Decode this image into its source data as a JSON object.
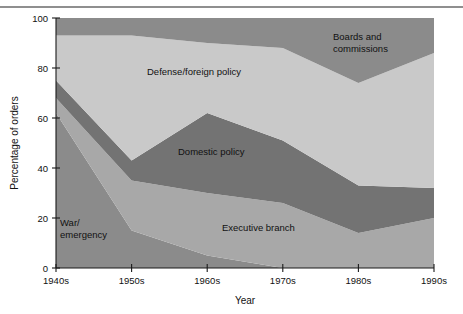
{
  "figure": {
    "background_color": "#ffffff",
    "top_rule_color": "#8f8f8f"
  },
  "chart_data": {
    "type": "area",
    "stacked": true,
    "title": "",
    "xlabel": "Year",
    "ylabel": "Percentage of orders",
    "categories": [
      "1940s",
      "1950s",
      "1960s",
      "1970s",
      "1980s",
      "1990s"
    ],
    "x_tick_labels": [
      "1940s",
      "1950s",
      "1960s",
      "1970s",
      "1980s",
      "1990s"
    ],
    "y_tick_labels": [
      "0",
      "20",
      "40",
      "60",
      "80",
      "100"
    ],
    "y_ticks": [
      0,
      20,
      40,
      60,
      80,
      100
    ],
    "ylim": [
      0,
      100
    ],
    "grid": false,
    "legend_position": "inline-annotations",
    "series": [
      {
        "name": "War/emergency",
        "label": "War/\nemergency",
        "color": "#8b8b8b",
        "values": [
          62,
          15,
          5,
          0,
          0,
          0
        ],
        "annotation": {
          "line1": "War/",
          "line2": "emergency"
        }
      },
      {
        "name": "Executive branch",
        "label": "Executive branch",
        "color": "#a8a8a8",
        "values": [
          6,
          20,
          25,
          26,
          14,
          20
        ],
        "annotation": {
          "line1": "Executive branch"
        }
      },
      {
        "name": "Domestic policy",
        "label": "Domestic policy",
        "color": "#737373",
        "values": [
          7,
          8,
          32,
          25,
          19,
          12
        ],
        "annotation": {
          "line1": "Domestic policy"
        }
      },
      {
        "name": "Defense/foreign policy",
        "label": "Defense/foreign policy",
        "color": "#c9c9c9",
        "values": [
          18,
          50,
          28,
          37,
          41,
          54
        ],
        "annotation": {
          "line1": "Defense/foreign policy"
        }
      },
      {
        "name": "Boards and commissions",
        "label": "Boards and commissions",
        "color": "#8b8b8b",
        "values": [
          7,
          7,
          10,
          12,
          26,
          14
        ],
        "annotation": {
          "line1": "Boards and",
          "line2": "commissions"
        }
      }
    ],
    "cumulative_tops": {
      "war_emergency": [
        62,
        15,
        5,
        0,
        0,
        0
      ],
      "executive_branch": [
        68,
        35,
        30,
        26,
        14,
        20
      ],
      "domestic_policy": [
        75,
        43,
        62,
        51,
        33,
        32
      ],
      "defense_foreign_policy": [
        93,
        93,
        90,
        88,
        74,
        86
      ],
      "boards_and_commissions": [
        100,
        100,
        100,
        100,
        100,
        100
      ]
    }
  }
}
